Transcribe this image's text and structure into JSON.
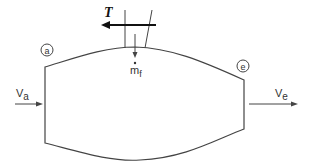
{
  "diagram": {
    "type": "control-volume-turbojet",
    "colors": {
      "stroke": "#444444",
      "text": "#333333",
      "thrust": "#111111",
      "background": "#ffffff"
    },
    "stations": {
      "inlet": {
        "label": "a"
      },
      "exit": {
        "label": "e"
      }
    },
    "flows": {
      "inlet_velocity": {
        "symbol": "V",
        "subscript": "a"
      },
      "exit_velocity": {
        "symbol": "V",
        "subscript": "e"
      },
      "fuel_flow": {
        "symbol": "m",
        "subscript": "f",
        "dot": "•"
      }
    },
    "force": {
      "label": "T"
    }
  }
}
